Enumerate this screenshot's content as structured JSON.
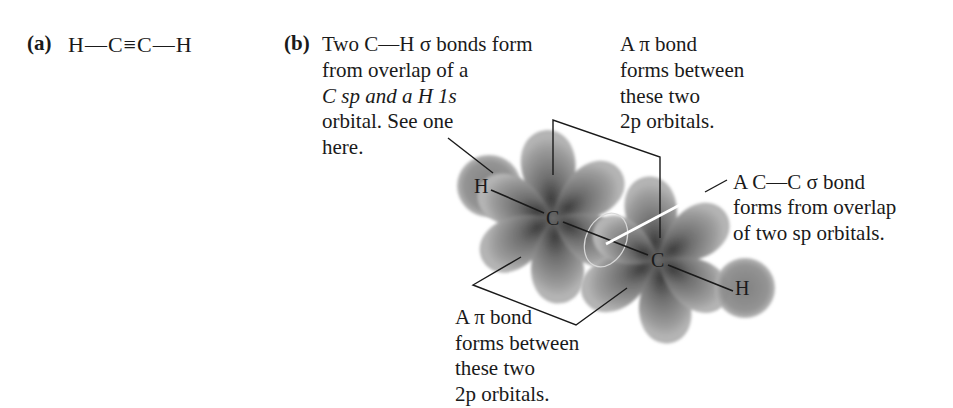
{
  "part_a": {
    "label": "(a)",
    "formula": "H—C≡C—H"
  },
  "part_b": {
    "label": "(b)",
    "ch_sigma_note": {
      "lines": [
        "Two C—H σ bonds form",
        "from overlap of a",
        "C sp and a H 1s",
        "orbital. See one",
        "here."
      ]
    },
    "pi_top_note": {
      "lines": [
        "A π bond",
        "forms between",
        "these two",
        "2p orbitals."
      ]
    },
    "cc_sigma_note": {
      "lines": [
        "A C—C σ bond",
        "forms from overlap",
        "of two sp orbitals."
      ]
    },
    "pi_bottom_note": {
      "lines": [
        "A π bond",
        "forms between",
        "these two",
        "2p orbitals."
      ]
    },
    "atoms": {
      "h_left": "H",
      "c_left": "C",
      "c_right": "C",
      "h_right": "H"
    }
  },
  "colors": {
    "orbital_fill": "#8a8a8a",
    "orbital_dark": "#4a4a4a",
    "text": "#1a1a1a",
    "background": "#ffffff"
  }
}
